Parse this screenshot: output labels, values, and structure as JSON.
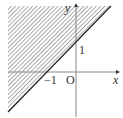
{
  "diagram": {
    "type": "inequality-region",
    "line": {
      "equation": "y = x + 1",
      "x_intercept": -1,
      "y_intercept": 1
    },
    "shaded_region": "above-left of line",
    "labels": {
      "x_axis": "x",
      "y_axis": "y",
      "origin": "O",
      "x_tick": "−1",
      "y_tick": "1"
    },
    "colors": {
      "hatch": "#555555",
      "line": "#222222",
      "axis": "#555555"
    }
  }
}
